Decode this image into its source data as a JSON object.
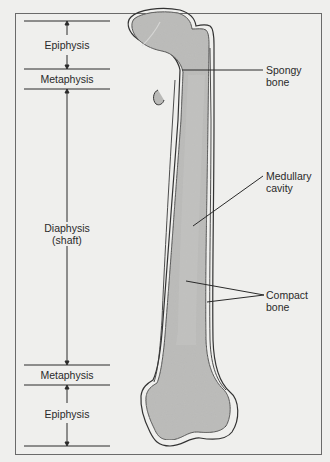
{
  "diagram": {
    "regions_left": [
      {
        "id": "epiphysis_top",
        "label": "Epiphysis"
      },
      {
        "id": "metaphysis_top",
        "label": "Metaphysis"
      },
      {
        "id": "diaphysis",
        "label": "Diaphysis",
        "sublabel": "(shaft)"
      },
      {
        "id": "metaphysis_bottom",
        "label": "Metaphysis"
      },
      {
        "id": "epiphysis_bottom",
        "label": "Epiphysis"
      }
    ],
    "callouts_right": [
      {
        "id": "spongy",
        "line1": "Spongy",
        "line2": "bone"
      },
      {
        "id": "medullary",
        "line1": "Medullary",
        "line2": "cavity"
      },
      {
        "id": "compact",
        "line1": "Compact",
        "line2": "bone"
      }
    ],
    "colors": {
      "background": "#efefed",
      "bone_fill": "#b9b9b7",
      "outline": "#333333",
      "frame": "#6a6a6a"
    }
  }
}
